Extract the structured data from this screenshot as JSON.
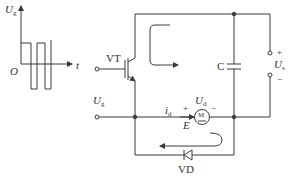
{
  "diagram": {
    "type": "circuit",
    "colors": {
      "line": "#3a3a3a",
      "background": "#ffffff"
    },
    "waveform": {
      "y_axis_label": "U",
      "y_axis_sub": "g",
      "origin_label": "O",
      "x_axis_label": "t"
    },
    "components": {
      "transistor": "VT",
      "capacitor": "C",
      "motor": "M",
      "diode": "VD"
    },
    "labels": {
      "gate_input": "U",
      "gate_input_sub": "g",
      "supply": "U",
      "supply_sub": "s",
      "supply_plus": "+",
      "supply_minus": "−",
      "motor_voltage": "U",
      "motor_voltage_sub": "d",
      "motor_current": "i",
      "motor_current_sub": "d",
      "motor_plus": "+",
      "motor_minus": "−",
      "back_emf": "E"
    }
  }
}
